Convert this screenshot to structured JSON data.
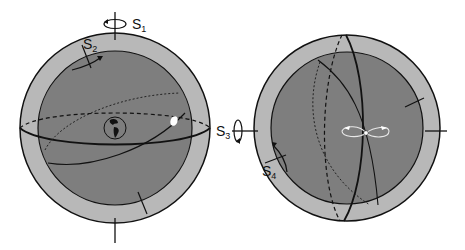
{
  "figure": {
    "colors": {
      "background": "#ffffff",
      "outer_shell": "#b8b8b8",
      "inner_sphere": "#7e7e7e",
      "stroke": "#111111",
      "highlight": "#ffffff"
    }
  },
  "left_sphere": {
    "labels": {
      "s1": {
        "main": "S",
        "sub": "1"
      },
      "s2": {
        "main": "S",
        "sub": "2"
      }
    },
    "features": [
      "earth-globe",
      "white-ellipse-marker",
      "equator-ring",
      "tilted-orbit"
    ]
  },
  "right_sphere": {
    "labels": {
      "s3": {
        "main": "S",
        "sub": "3"
      },
      "s4": {
        "main": "S",
        "sub": "4"
      }
    },
    "features": [
      "figure-eight-loop",
      "meridian-rings",
      "center-point"
    ]
  }
}
